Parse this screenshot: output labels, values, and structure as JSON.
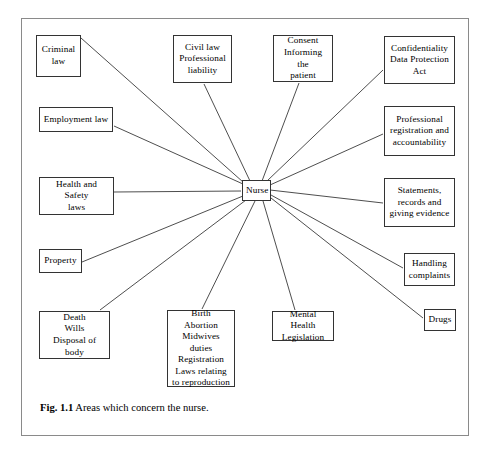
{
  "figure": {
    "caption_label": "Fig. 1.1",
    "caption_text": "Areas which concern the nurse.",
    "frame_color": "#8a8a8a",
    "box_border_color": "#333333",
    "line_color": "#3a3a3a",
    "background": "#ffffff"
  },
  "diagram": {
    "type": "radial-node-link",
    "center": {
      "id": "nurse",
      "label": "Nurse",
      "x": 242,
      "y": 180,
      "width": 29,
      "height": 21
    },
    "nodes": [
      {
        "id": "criminal-law",
        "label": "Criminal\nlaw",
        "lines": [
          "Criminal",
          "law"
        ],
        "x": 36,
        "y": 35,
        "width": 45,
        "height": 42,
        "anchor": "right-top"
      },
      {
        "id": "civil-law",
        "label": "Civil law\nProfessional\nliability",
        "lines": [
          "Civil law",
          "Professional",
          "liability"
        ],
        "x": 173,
        "y": 35,
        "width": 59,
        "height": 48,
        "anchor": "bottom"
      },
      {
        "id": "consent",
        "label": "Consent\nInforming the\npatient",
        "lines": [
          "Consent",
          "Informing the",
          "patient"
        ],
        "x": 273,
        "y": 35,
        "width": 60,
        "height": 47,
        "anchor": "bottom"
      },
      {
        "id": "confidentiality",
        "label": "Confidentiality\nData Protection\nAct",
        "lines": [
          "Confidentiality",
          "Data Protection",
          "Act"
        ],
        "x": 384,
        "y": 36,
        "width": 71,
        "height": 48,
        "anchor": "left-bottom"
      },
      {
        "id": "employment-law",
        "label": "Employment law",
        "lines": [
          "Employment law"
        ],
        "x": 39,
        "y": 107,
        "width": 74,
        "height": 25,
        "anchor": "right"
      },
      {
        "id": "professional-registration",
        "label": "Professional\nregistration and\naccountability",
        "lines": [
          "Professional",
          "registration and",
          "accountability"
        ],
        "x": 384,
        "y": 106,
        "width": 71,
        "height": 50,
        "anchor": "left"
      },
      {
        "id": "health-safety",
        "label": "Health and Safety\nlaws",
        "lines": [
          "Health and Safety",
          "laws"
        ],
        "x": 39,
        "y": 177,
        "width": 75,
        "height": 38,
        "anchor": "right"
      },
      {
        "id": "statements-records",
        "label": "Statements,\nrecords and\ngiving evidence",
        "lines": [
          "Statements,",
          "records and",
          "giving evidence"
        ],
        "x": 384,
        "y": 178,
        "width": 71,
        "height": 49,
        "anchor": "left"
      },
      {
        "id": "property",
        "label": "Property",
        "lines": [
          "Property"
        ],
        "x": 39,
        "y": 249,
        "width": 43,
        "height": 24,
        "anchor": "right"
      },
      {
        "id": "handling-complaints",
        "label": "Handling\ncomplaints",
        "lines": [
          "Handling",
          "complaints"
        ],
        "x": 404,
        "y": 253,
        "width": 51,
        "height": 33,
        "anchor": "left"
      },
      {
        "id": "death-wills",
        "label": "Death\nWills\nDisposal of body",
        "lines": [
          "Death",
          "Wills",
          "Disposal of body"
        ],
        "x": 39,
        "y": 311,
        "width": 71,
        "height": 48,
        "anchor": "top-right"
      },
      {
        "id": "birth-abortion",
        "label": "Birth\nAbortion\nMidwives duties\nRegistration\nLaws relating\nto reproduction",
        "lines": [
          "Birth",
          "Abortion",
          "Midwives duties",
          "Registration",
          "Laws relating",
          "to reproduction"
        ],
        "x": 167,
        "y": 310,
        "width": 68,
        "height": 77,
        "anchor": "top"
      },
      {
        "id": "mental-health",
        "label": "Mental Health\nLegislation",
        "lines": [
          "Mental Health",
          "Legislation"
        ],
        "x": 272,
        "y": 311,
        "width": 62,
        "height": 30,
        "anchor": "top"
      },
      {
        "id": "drugs",
        "label": "Drugs",
        "lines": [
          "Drugs"
        ],
        "x": 424,
        "y": 309,
        "width": 32,
        "height": 22,
        "anchor": "left-top"
      }
    ],
    "edges": [
      {
        "from": "nurse",
        "to": "criminal-law",
        "x1": 243,
        "y1": 182,
        "x2": 81,
        "y2": 38
      },
      {
        "from": "nurse",
        "to": "civil-law",
        "x1": 250,
        "y1": 181,
        "x2": 204,
        "y2": 84
      },
      {
        "from": "nurse",
        "to": "consent",
        "x1": 262,
        "y1": 181,
        "x2": 299,
        "y2": 83
      },
      {
        "from": "nurse",
        "to": "confidentiality",
        "x1": 267,
        "y1": 181,
        "x2": 383,
        "y2": 70
      },
      {
        "from": "nurse",
        "to": "employment-law",
        "x1": 243,
        "y1": 184,
        "x2": 114,
        "y2": 126
      },
      {
        "from": "nurse",
        "to": "professional-registration",
        "x1": 270,
        "y1": 185,
        "x2": 383,
        "y2": 134
      },
      {
        "from": "nurse",
        "to": "health-safety",
        "x1": 241,
        "y1": 191,
        "x2": 114,
        "y2": 192
      },
      {
        "from": "nurse",
        "to": "statements-records",
        "x1": 270,
        "y1": 190,
        "x2": 383,
        "y2": 203
      },
      {
        "from": "nurse",
        "to": "property",
        "x1": 243,
        "y1": 196,
        "x2": 82,
        "y2": 262
      },
      {
        "from": "nurse",
        "to": "handling-complaints",
        "x1": 271,
        "y1": 195,
        "x2": 403,
        "y2": 268
      },
      {
        "from": "nurse",
        "to": "death-wills",
        "x1": 246,
        "y1": 200,
        "x2": 100,
        "y2": 310
      },
      {
        "from": "nurse",
        "to": "birth-abortion",
        "x1": 255,
        "y1": 201,
        "x2": 202,
        "y2": 309
      },
      {
        "from": "nurse",
        "to": "mental-health",
        "x1": 263,
        "y1": 201,
        "x2": 295,
        "y2": 310
      },
      {
        "from": "nurse",
        "to": "drugs",
        "x1": 271,
        "y1": 198,
        "x2": 423,
        "y2": 318
      }
    ]
  }
}
